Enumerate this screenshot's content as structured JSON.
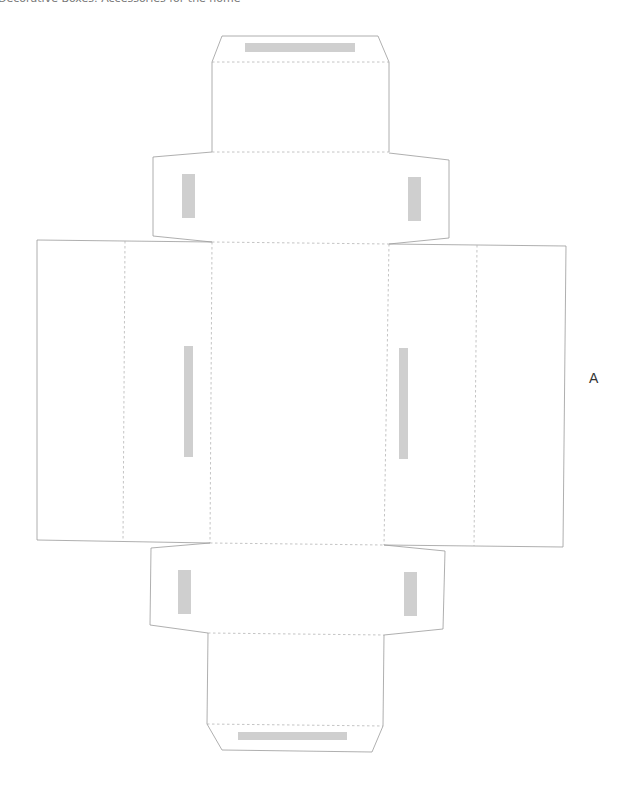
{
  "header": {
    "title": "Decorative Boxes: Accessories for the home"
  },
  "template": {
    "label": "A",
    "glue_color": "#cfcfcf",
    "cut_line_color": "#9a9a9a",
    "fold_line_color": "#b5b5b5"
  }
}
